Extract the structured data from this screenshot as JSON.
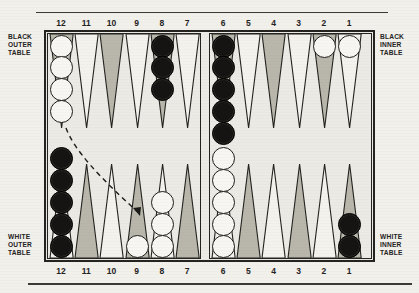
{
  "diagram": {
    "colors": {
      "paper": "#f2f0ea",
      "ink": "#24231f",
      "point_shaded": "#b9b6ac",
      "point_light": "#f4f2ed",
      "checker_white": "#f7f6f2",
      "checker_black": "#151412"
    }
  },
  "labels": {
    "top_numbers": [
      "12",
      "11",
      "10",
      "9",
      "8",
      "7",
      "6",
      "5",
      "4",
      "3",
      "2",
      "1"
    ],
    "bottom_numbers": [
      "12",
      "11",
      "10",
      "9",
      "8",
      "7",
      "6",
      "5",
      "4",
      "3",
      "2",
      "1"
    ]
  },
  "captions": {
    "black_outer": "BLACK OUTER TABLE",
    "black_inner": "BLACK INNER TABLE",
    "white_outer": "WHITE OUTER TABLE",
    "white_inner": "WHITE INNER TABLE"
  },
  "board": {
    "top_points": [
      {
        "number": "12",
        "shade": "shaded",
        "checkers": 4,
        "color": "white"
      },
      {
        "number": "11",
        "shade": "light",
        "checkers": 0,
        "color": null
      },
      {
        "number": "10",
        "shade": "shaded",
        "checkers": 0,
        "color": null
      },
      {
        "number": "9",
        "shade": "light",
        "checkers": 0,
        "color": null
      },
      {
        "number": "8",
        "shade": "shaded",
        "checkers": 3,
        "color": "black"
      },
      {
        "number": "7",
        "shade": "light",
        "checkers": 0,
        "color": null
      },
      {
        "number": "6",
        "shade": "shaded",
        "checkers": 5,
        "color": "black"
      },
      {
        "number": "5",
        "shade": "light",
        "checkers": 0,
        "color": null
      },
      {
        "number": "4",
        "shade": "shaded",
        "checkers": 0,
        "color": null
      },
      {
        "number": "3",
        "shade": "light",
        "checkers": 0,
        "color": null
      },
      {
        "number": "2",
        "shade": "shaded",
        "checkers": 1,
        "color": "white"
      },
      {
        "number": "1",
        "shade": "light",
        "checkers": 1,
        "color": "white"
      }
    ],
    "bottom_points": [
      {
        "number": "12",
        "shade": "light",
        "checkers": 5,
        "color": "black"
      },
      {
        "number": "11",
        "shade": "shaded",
        "checkers": 0,
        "color": null
      },
      {
        "number": "10",
        "shade": "light",
        "checkers": 0,
        "color": null
      },
      {
        "number": "9",
        "shade": "shaded",
        "checkers": 1,
        "color": "white"
      },
      {
        "number": "8",
        "shade": "light",
        "checkers": 3,
        "color": "white"
      },
      {
        "number": "7",
        "shade": "shaded",
        "checkers": 0,
        "color": null
      },
      {
        "number": "6",
        "shade": "light",
        "checkers": 5,
        "color": "white"
      },
      {
        "number": "5",
        "shade": "shaded",
        "checkers": 0,
        "color": null
      },
      {
        "number": "4",
        "shade": "light",
        "checkers": 0,
        "color": null
      },
      {
        "number": "3",
        "shade": "shaded",
        "checkers": 0,
        "color": null
      },
      {
        "number": "2",
        "shade": "light",
        "checkers": 0,
        "color": null
      },
      {
        "number": "1",
        "shade": "shaded",
        "checkers": 2,
        "color": "black"
      }
    ],
    "move_arrow": {
      "from_point": "12",
      "to_point": "9",
      "style": "dashed-curve",
      "head": "arrowhead"
    }
  }
}
